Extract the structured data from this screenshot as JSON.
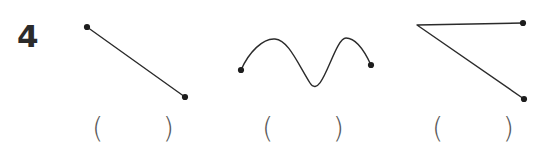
{
  "problem": {
    "number": "4",
    "background_color": "#ffffff",
    "ink_color": "#2b2b2b",
    "paren_color": "#5a5a5a"
  },
  "figures": [
    {
      "id": "figure-1",
      "name": "straight-line-segment",
      "kind": "line",
      "endpoint_dots": 2,
      "points": [
        [
          87,
          27
        ],
        [
          185,
          97
        ]
      ]
    },
    {
      "id": "figure-2",
      "name": "wavy-curve",
      "kind": "curve",
      "endpoint_dots": 2,
      "points": [
        [
          241,
          70
        ],
        [
          275,
          39
        ],
        [
          310,
          83
        ],
        [
          345,
          38
        ],
        [
          371,
          65
        ]
      ]
    },
    {
      "id": "figure-3",
      "name": "angle-two-rays",
      "kind": "angle",
      "endpoint_dots": 2,
      "vertex": [
        417,
        25
      ],
      "points": [
        [
          523,
          23
        ],
        [
          417,
          25
        ],
        [
          524,
          99
        ]
      ]
    }
  ],
  "answers": [
    {
      "id": "blank-1",
      "open": "(",
      "value": "",
      "close": ")"
    },
    {
      "id": "blank-2",
      "open": "(",
      "value": "",
      "close": ")"
    },
    {
      "id": "blank-3",
      "open": "(",
      "value": "",
      "close": ")"
    }
  ]
}
